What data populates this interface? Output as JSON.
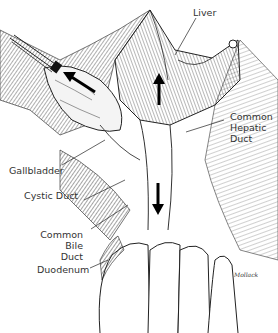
{
  "figure": {
    "labels": {
      "liver": "Liver",
      "common_hepatic_duct": [
        "Common",
        "Hepatic",
        "Duct"
      ],
      "gallbladder": "Gallbladder",
      "cystic_duct": "Cystic Duct",
      "common_bile_duct": [
        "Common",
        "Bile",
        "Duct"
      ],
      "duodenum": "Duodenum"
    },
    "signature": "Mollack",
    "arrows": [
      {
        "name": "gallbladder-retraction-arrow",
        "direction": "up-left"
      },
      {
        "name": "liver-retraction-arrow",
        "direction": "up"
      },
      {
        "name": "duodenum-traction-arrow",
        "direction": "down"
      }
    ]
  }
}
